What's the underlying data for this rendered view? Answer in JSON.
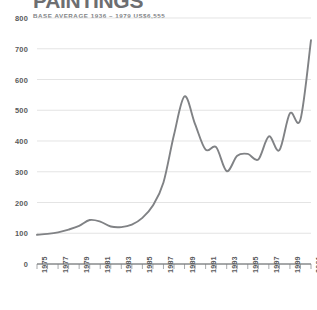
{
  "header": {
    "title": "PAINTINGS",
    "subtitle": "BASE AVERAGE 1936 – 1979 US$6,555"
  },
  "colors": {
    "line": "#808285",
    "grid": "#d9d9d9",
    "axis": "#808285",
    "text": "#58595b",
    "title": "#6d6e71",
    "subtitle": "#808285",
    "background": "#ffffff"
  },
  "chart_data": {
    "type": "line",
    "title": "PAINTINGS",
    "subtitle": "BASE AVERAGE 1936 – 1979 US$6,555",
    "xlabel": "",
    "ylabel": "",
    "xlim": [
      1975,
      2001
    ],
    "ylim": [
      0,
      800
    ],
    "grid": true,
    "legend": false,
    "ytick_labels": [
      "800",
      "700",
      "600",
      "500",
      "400",
      "300",
      "200",
      "100",
      "0"
    ],
    "ytick_values": [
      800,
      700,
      600,
      500,
      400,
      300,
      200,
      100,
      0
    ],
    "xtick_labels": [
      "1975",
      "1977",
      "1979",
      "1981",
      "1983",
      "1985",
      "1987",
      "1989",
      "1991",
      "1993",
      "1995",
      "1997",
      "1999",
      "2001"
    ],
    "xtick_values": [
      1975,
      1977,
      1979,
      1981,
      1983,
      1985,
      1987,
      1989,
      1991,
      1993,
      1995,
      1997,
      1999,
      2001
    ],
    "minor_xticks": [
      1975,
      1976,
      1977,
      1978,
      1979,
      1980,
      1981,
      1982,
      1983,
      1984,
      1985,
      1986,
      1987,
      1988,
      1989,
      1990,
      1991,
      1992,
      1993,
      1994,
      1995,
      1996,
      1997,
      1998,
      1999,
      2000,
      2001
    ],
    "x": [
      1975,
      1976,
      1977,
      1978,
      1979,
      1980,
      1981,
      1982,
      1983,
      1984,
      1985,
      1986,
      1987,
      1988,
      1989,
      1990,
      1991,
      1992,
      1993,
      1994,
      1995,
      1996,
      1997,
      1998,
      1999,
      2000,
      2001
    ],
    "values": [
      95,
      98,
      103,
      112,
      124,
      143,
      138,
      122,
      120,
      128,
      150,
      190,
      265,
      420,
      545,
      455,
      372,
      380,
      302,
      352,
      358,
      340,
      415,
      370,
      490,
      470,
      728
    ],
    "series": [
      {
        "name": "Paintings index",
        "values": [
          95,
          98,
          103,
          112,
          124,
          143,
          138,
          122,
          120,
          128,
          150,
          190,
          265,
          420,
          545,
          455,
          372,
          380,
          302,
          352,
          358,
          340,
          415,
          370,
          490,
          470,
          728
        ]
      }
    ]
  }
}
